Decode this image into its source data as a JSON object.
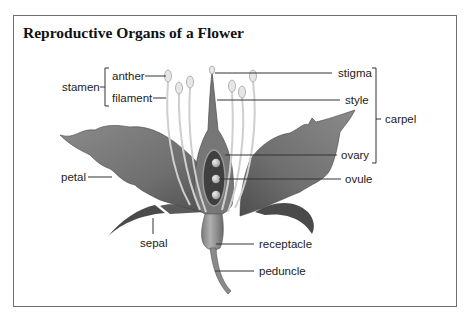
{
  "title": "Reproductive Organs of a Flower",
  "labels": {
    "stamen": "stamen",
    "anther": "anther",
    "filament": "filament",
    "stigma": "stigma",
    "style": "style",
    "carpel": "carpel",
    "ovary": "ovary",
    "ovule": "ovule",
    "petal": "petal",
    "sepal": "sepal",
    "receptacle": "receptacle",
    "peduncle": "peduncle"
  },
  "groups": {
    "stamen": [
      "anther",
      "filament"
    ],
    "carpel": [
      "stigma",
      "style",
      "ovary"
    ]
  },
  "colors": {
    "border": "#6e6e6e",
    "petal": "#7a7a7a",
    "petal_dark": "#555555",
    "stamen": "#c8c8c8",
    "text": "#222222"
  }
}
